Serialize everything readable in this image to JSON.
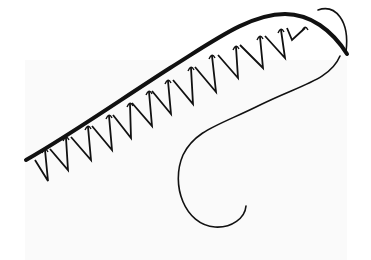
{
  "diagram": {
    "colors": {
      "background": "#ffffff",
      "panel": "#fafafa",
      "stroke": "#111111"
    },
    "main_line": {
      "path": "M26,160 C70,135 120,100 170,68 C215,40 250,14 285,14 C310,14 332,30 347,54",
      "width": 4
    },
    "stitches": [
      {
        "top": [
          45,
          150
        ],
        "bottom": [
          48,
          181
        ],
        "prev": [
          35,
          160
        ]
      },
      {
        "top": [
          66,
          138
        ],
        "bottom": [
          68,
          170
        ],
        "prev": [
          50,
          149
        ]
      },
      {
        "top": [
          88,
          127
        ],
        "bottom": [
          91,
          160
        ],
        "prev": [
          71,
          137
        ]
      },
      {
        "top": [
          109,
          116
        ],
        "bottom": [
          112,
          150
        ],
        "prev": [
          92,
          126
        ]
      },
      {
        "top": [
          130,
          104
        ],
        "bottom": [
          131,
          138
        ],
        "prev": [
          113,
          115
        ]
      },
      {
        "top": [
          149,
          92
        ],
        "bottom": [
          152,
          126
        ],
        "prev": [
          132,
          103
        ]
      },
      {
        "top": [
          168,
          81
        ],
        "bottom": [
          171,
          114
        ],
        "prev": [
          152,
          91
        ]
      },
      {
        "top": [
          191,
          68
        ],
        "bottom": [
          193,
          104
        ],
        "prev": [
          173,
          80
        ]
      },
      {
        "top": [
          212,
          56
        ],
        "bottom": [
          216,
          92
        ],
        "prev": [
          195,
          67
        ]
      },
      {
        "top": [
          236,
          47
        ],
        "bottom": [
          238,
          78
        ],
        "prev": [
          218,
          55
        ]
      },
      {
        "top": [
          260,
          37
        ],
        "bottom": [
          263,
          68
        ],
        "prev": [
          240,
          45
        ]
      },
      {
        "top": [
          281,
          30
        ],
        "bottom": [
          285,
          58
        ],
        "prev": [
          265,
          36
        ]
      },
      {
        "top": [
          305,
          28
        ],
        "bottom": [
          292,
          40
        ],
        "prev": [
          287,
          28
        ]
      }
    ],
    "thread": {
      "loop_path": "M318,10 C335,4 350,20 346,52",
      "strand_path": "M340,56 C330,80 300,85 260,105 C220,125 195,130 183,155 C170,185 185,225 215,227 C232,228 245,218 246,206",
      "width": 1.6
    }
  }
}
